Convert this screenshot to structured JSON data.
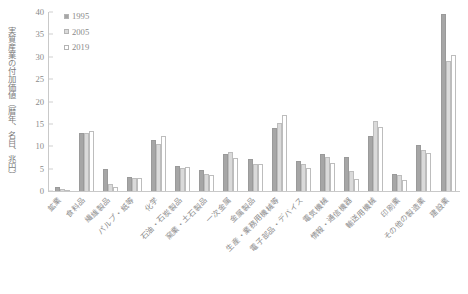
{
  "chart_data": {
    "type": "bar",
    "title": "",
    "xlabel": "",
    "ylabel": "実質産業の付加価値（暦年、名目、兆円）",
    "ylim": [
      0,
      40
    ],
    "ytick_step": 5,
    "yticks": [
      "40",
      "35",
      "30",
      "25",
      "20",
      "15",
      "10",
      "5",
      "0"
    ],
    "grid": false,
    "legend_position": "top-left",
    "categories": [
      "鉱業",
      "食料品",
      "繊維製品",
      "パルプ・紙等",
      "化学",
      "石油・石炭製品",
      "窯業・土石製品",
      "一次金属",
      "金属製品",
      "生産・業務用機械等",
      "電子部品・デバイス",
      "電気機械",
      "情報・通信機器",
      "輸送用機械",
      "印刷業",
      "その他の製造業",
      "建設業"
    ],
    "series": [
      {
        "name": "1995",
        "color": "#a6a6a6",
        "values": [
          0.9,
          13.0,
          4.9,
          3.2,
          11.3,
          5.5,
          4.8,
          8.2,
          7.2,
          14.0,
          6.8,
          8.3,
          7.5,
          12.3,
          3.8,
          10.3,
          39.5
        ]
      },
      {
        "name": "2005",
        "color": "#dadada",
        "values": [
          0.4,
          13.0,
          1.5,
          2.8,
          10.5,
          5.1,
          3.7,
          8.8,
          6.0,
          15.3,
          6.0,
          7.7,
          4.5,
          15.7,
          3.6,
          9.1,
          29.0
        ]
      },
      {
        "name": "2019",
        "color": "#ffffff",
        "values": [
          0.3,
          13.5,
          0.8,
          2.9,
          12.4,
          5.3,
          3.6,
          7.4,
          6.1,
          17.0,
          5.2,
          6.2,
          2.6,
          14.3,
          2.4,
          8.6,
          30.5
        ]
      }
    ]
  },
  "legend": {
    "items": [
      {
        "label": "1995",
        "swatch": "#a6a6a6"
      },
      {
        "label": "2005",
        "swatch": "#dadada"
      },
      {
        "label": "2019",
        "swatch": "#ffffff"
      }
    ]
  },
  "colors": {
    "axis": "#c9c9c9",
    "tick_text": "#8a8a8a",
    "label_text": "#8d8d8d",
    "background": "#ffffff"
  }
}
